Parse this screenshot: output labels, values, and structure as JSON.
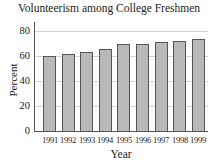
{
  "chart_data": {
    "type": "bar",
    "title": "Volunteerism among College Freshmen",
    "xlabel": "Year",
    "ylabel": "Percent",
    "categories": [
      "1991",
      "1992",
      "1993",
      "1994",
      "1995",
      "1996",
      "1997",
      "1998",
      "1999"
    ],
    "values": [
      60,
      62,
      63,
      66,
      70,
      70,
      71,
      72,
      74
    ],
    "ylim": [
      0,
      90
    ],
    "yticks": [
      0,
      20,
      40,
      60,
      80
    ],
    "grid": true,
    "legend": null,
    "bar_color": "#b9b9b9",
    "border_color": "#555555"
  }
}
